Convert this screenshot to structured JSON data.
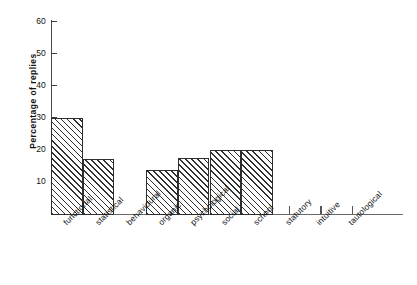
{
  "chart_data": {
    "type": "bar",
    "title": "",
    "xlabel": "",
    "ylabel": "Percentage of replies",
    "ylim": [
      0,
      60
    ],
    "yticks": [
      10,
      20,
      30,
      40,
      50,
      60
    ],
    "grid": false,
    "legend": null,
    "categories": [
      "functional",
      "statistical",
      "behavioural",
      "organic",
      "psychological",
      "social",
      "school",
      "statutory",
      "intuitive",
      "tautological"
    ],
    "values": [
      30,
      17,
      0,
      13.5,
      17.5,
      20,
      20,
      0,
      0,
      0
    ],
    "bar_style": {
      "fill": "#fdfdfd",
      "hatch": "diagonal-45",
      "hatch_color": "#2f2f2f",
      "edge_color": "#2e2e2e"
    }
  }
}
